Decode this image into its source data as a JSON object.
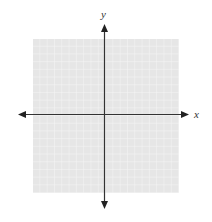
{
  "diagram": {
    "type": "coordinate-plane",
    "x_axis_label": "x",
    "y_axis_label": "y",
    "grid_cells_per_side": 20,
    "colors": {
      "grid_fill": "#e6e6e6",
      "grid_lines": "#f8f8f8",
      "axis": "#333333"
    }
  }
}
